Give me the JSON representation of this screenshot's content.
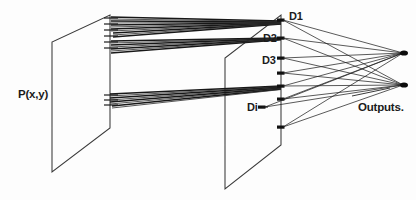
{
  "figure": {
    "kind": "optical-neural-network-schematic",
    "background_color": "#fdfdfd",
    "ink_color": "#1b1b1b",
    "labels": {
      "input_plane": "P(x,y)",
      "detector_1": "D1",
      "detector_2": "D2",
      "detector_3": "D3",
      "detector_i": "Di",
      "outputs": "Outputs."
    },
    "geometry": {
      "input_plane_quad": [
        [
          110,
          15
        ],
        [
          110,
          128
        ],
        [
          52,
          172
        ],
        [
          52,
          42
        ]
      ],
      "detector_plane_quad": [
        [
          281,
          15
        ],
        [
          281,
          145
        ],
        [
          225,
          189
        ],
        [
          225,
          58
        ]
      ],
      "detector_nodes_x": 281,
      "detector_nodes_y": [
        20,
        38,
        58,
        73,
        86,
        99,
        112,
        127
      ],
      "output_nodes": [
        [
          404,
          53
        ],
        [
          404,
          85
        ]
      ],
      "ray_bundle_upper_source_y": [
        18,
        24,
        30,
        36,
        42,
        48
      ],
      "ray_bundle_lower_source_y": [
        96,
        100,
        104,
        108
      ],
      "upper_bundle_target": [
        281,
        22
      ],
      "second_bundle_target": [
        281,
        40
      ],
      "lower_bundle_target": [
        281,
        88
      ]
    },
    "counts": {
      "detectors_drawn": 8,
      "outputs": 2
    }
  }
}
